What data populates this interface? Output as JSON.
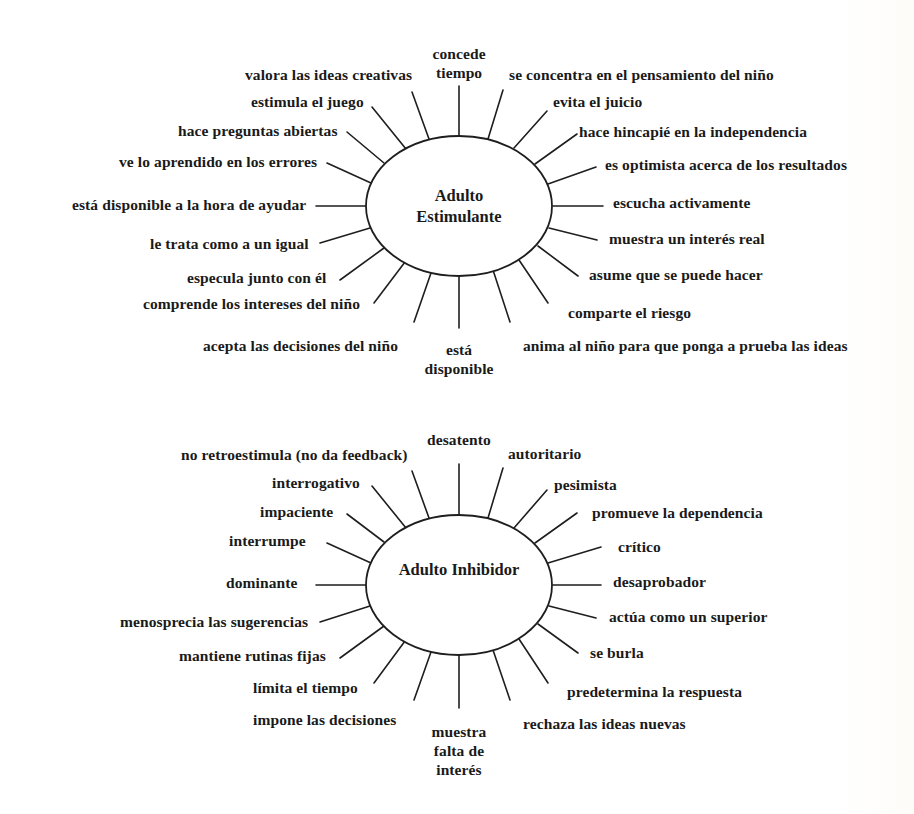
{
  "diagrams": [
    {
      "id": "top",
      "hub": {
        "title_line1": "Adulto",
        "title_line2": "Estimulante",
        "cx": 459,
        "cy": 206,
        "rx": 93,
        "ry": 70
      },
      "spokes": [
        {
          "label": "concede\ntiempo",
          "x1": 459,
          "y1": 136,
          "x2": 459,
          "y2": 86,
          "lx": 459,
          "ly": 44,
          "align": "center"
        },
        {
          "label": "se concentra en el pensamiento del niño",
          "x1": 488,
          "y1": 139,
          "x2": 503,
          "y2": 90,
          "lx": 509,
          "ly": 65,
          "align": "left"
        },
        {
          "label": "evita el juicio",
          "x1": 514,
          "y1": 148,
          "x2": 547,
          "y2": 111,
          "lx": 553,
          "ly": 92,
          "align": "left"
        },
        {
          "label": "hace hincapié en la independencia",
          "x1": 535,
          "y1": 164,
          "x2": 577,
          "y2": 134,
          "lx": 579,
          "ly": 122,
          "align": "left"
        },
        {
          "label": "es optimista acerca de los resultados",
          "x1": 548,
          "y1": 184,
          "x2": 596,
          "y2": 167,
          "lx": 605,
          "ly": 155,
          "align": "left"
        },
        {
          "label": "escucha activamente",
          "x1": 553,
          "y1": 206,
          "x2": 603,
          "y2": 206,
          "lx": 613,
          "ly": 193,
          "align": "left"
        },
        {
          "label": "muestra un interés real",
          "x1": 549,
          "y1": 228,
          "x2": 597,
          "y2": 240,
          "lx": 609,
          "ly": 229,
          "align": "left"
        },
        {
          "label": "asume que se puede hacer",
          "x1": 538,
          "y1": 246,
          "x2": 578,
          "y2": 276,
          "lx": 589,
          "ly": 265,
          "align": "left"
        },
        {
          "label": "comparte el riesgo",
          "x1": 519,
          "y1": 260,
          "x2": 548,
          "y2": 303,
          "lx": 568,
          "ly": 303,
          "align": "left"
        },
        {
          "label": "anima al niño para que ponga a prueba las ideas",
          "x1": 493,
          "y1": 270,
          "x2": 510,
          "y2": 322,
          "lx": 523,
          "ly": 336,
          "align": "left"
        },
        {
          "label": "está\ndisponible",
          "x1": 459,
          "y1": 276,
          "x2": 459,
          "y2": 328,
          "lx": 459,
          "ly": 340,
          "align": "center"
        },
        {
          "label": "acepta las decisiones del niño",
          "x1": 431,
          "y1": 273,
          "x2": 414,
          "y2": 322,
          "lx": 398,
          "ly": 336,
          "align": "right"
        },
        {
          "label": "comprende los intereses del niño",
          "x1": 405,
          "y1": 262,
          "x2": 374,
          "y2": 303,
          "lx": 360,
          "ly": 294,
          "align": "right"
        },
        {
          "label": "especula junto con él",
          "x1": 384,
          "y1": 248,
          "x2": 340,
          "y2": 280,
          "lx": 326,
          "ly": 268,
          "align": "right"
        },
        {
          "label": "le trata como a un igual",
          "x1": 370,
          "y1": 228,
          "x2": 320,
          "y2": 243,
          "lx": 309,
          "ly": 234,
          "align": "right"
        },
        {
          "label": "está disponible a la hora de ayudar",
          "x1": 366,
          "y1": 206,
          "x2": 316,
          "y2": 206,
          "lx": 306,
          "ly": 195,
          "align": "right"
        },
        {
          "label": "ve lo aprendido en los errores",
          "x1": 371,
          "y1": 183,
          "x2": 327,
          "y2": 163,
          "lx": 317,
          "ly": 152,
          "align": "right"
        },
        {
          "label": "hace preguntas abiertas",
          "x1": 384,
          "y1": 163,
          "x2": 347,
          "y2": 132,
          "lx": 338,
          "ly": 121,
          "align": "right"
        },
        {
          "label": "estimula el juego",
          "x1": 406,
          "y1": 149,
          "x2": 372,
          "y2": 107,
          "lx": 364,
          "ly": 92,
          "align": "right"
        },
        {
          "label": "valora las ideas creativas",
          "x1": 429,
          "y1": 139,
          "x2": 412,
          "y2": 92,
          "lx": 412,
          "ly": 65,
          "align": "right"
        }
      ]
    },
    {
      "id": "bottom",
      "hub": {
        "title_line1": "Adulto Inhibidor",
        "title_line2": "",
        "cx": 459,
        "cy": 185,
        "rx": 93,
        "ry": 70
      },
      "spokes": [
        {
          "label": "desatento",
          "x1": 459,
          "y1": 115,
          "x2": 459,
          "y2": 64,
          "lx": 459,
          "ly": 30,
          "align": "center"
        },
        {
          "label": "autoritario",
          "x1": 488,
          "y1": 118,
          "x2": 503,
          "y2": 68,
          "lx": 508,
          "ly": 44,
          "align": "left"
        },
        {
          "label": "pesimista",
          "x1": 514,
          "y1": 128,
          "x2": 547,
          "y2": 90,
          "lx": 554,
          "ly": 75,
          "align": "left"
        },
        {
          "label": "promueve la dependencia",
          "x1": 535,
          "y1": 143,
          "x2": 577,
          "y2": 113,
          "lx": 592,
          "ly": 103,
          "align": "left"
        },
        {
          "label": "crítico",
          "x1": 548,
          "y1": 163,
          "x2": 601,
          "y2": 147,
          "lx": 618,
          "ly": 137,
          "align": "left"
        },
        {
          "label": "desaprobador",
          "x1": 553,
          "y1": 185,
          "x2": 601,
          "y2": 185,
          "lx": 613,
          "ly": 172,
          "align": "left"
        },
        {
          "label": "actúa como un superior",
          "x1": 549,
          "y1": 206,
          "x2": 596,
          "y2": 218,
          "lx": 609,
          "ly": 207,
          "align": "left"
        },
        {
          "label": "se burla",
          "x1": 538,
          "y1": 224,
          "x2": 578,
          "y2": 253,
          "lx": 590,
          "ly": 243,
          "align": "left"
        },
        {
          "label": "predetermina la respuesta",
          "x1": 519,
          "y1": 239,
          "x2": 548,
          "y2": 283,
          "lx": 567,
          "ly": 282,
          "align": "left"
        },
        {
          "label": "rechaza las ideas nuevas",
          "x1": 493,
          "y1": 250,
          "x2": 510,
          "y2": 300,
          "lx": 523,
          "ly": 314,
          "align": "left"
        },
        {
          "label": "muestra\nfalta de\ninterés",
          "x1": 459,
          "y1": 255,
          "x2": 459,
          "y2": 308,
          "lx": 459,
          "ly": 322,
          "align": "center"
        },
        {
          "label": "impone las decisiones",
          "x1": 431,
          "y1": 252,
          "x2": 414,
          "y2": 300,
          "lx": 396,
          "ly": 310,
          "align": "right"
        },
        {
          "label": "límita el tiempo",
          "x1": 405,
          "y1": 241,
          "x2": 374,
          "y2": 283,
          "lx": 358,
          "ly": 278,
          "align": "right"
        },
        {
          "label": "mantiene rutinas fijas",
          "x1": 384,
          "y1": 226,
          "x2": 340,
          "y2": 258,
          "lx": 326,
          "ly": 246,
          "align": "right"
        },
        {
          "label": "menosprecia las sugerencias",
          "x1": 370,
          "y1": 206,
          "x2": 320,
          "y2": 222,
          "lx": 308,
          "ly": 212,
          "align": "right"
        },
        {
          "label": "dominante",
          "x1": 366,
          "y1": 185,
          "x2": 316,
          "y2": 185,
          "lx": 298,
          "ly": 173,
          "align": "right"
        },
        {
          "label": "interrumpe",
          "x1": 371,
          "y1": 163,
          "x2": 327,
          "y2": 143,
          "lx": 306,
          "ly": 131,
          "align": "right"
        },
        {
          "label": "impaciente",
          "x1": 384,
          "y1": 142,
          "x2": 347,
          "y2": 114,
          "lx": 333,
          "ly": 102,
          "align": "right"
        },
        {
          "label": "interrogativo",
          "x1": 406,
          "y1": 128,
          "x2": 372,
          "y2": 86,
          "lx": 360,
          "ly": 73,
          "align": "right"
        },
        {
          "label": "no retroestimula (no da feedback)",
          "x1": 429,
          "y1": 118,
          "x2": 412,
          "y2": 71,
          "lx": 408,
          "ly": 45,
          "align": "right"
        }
      ]
    }
  ]
}
